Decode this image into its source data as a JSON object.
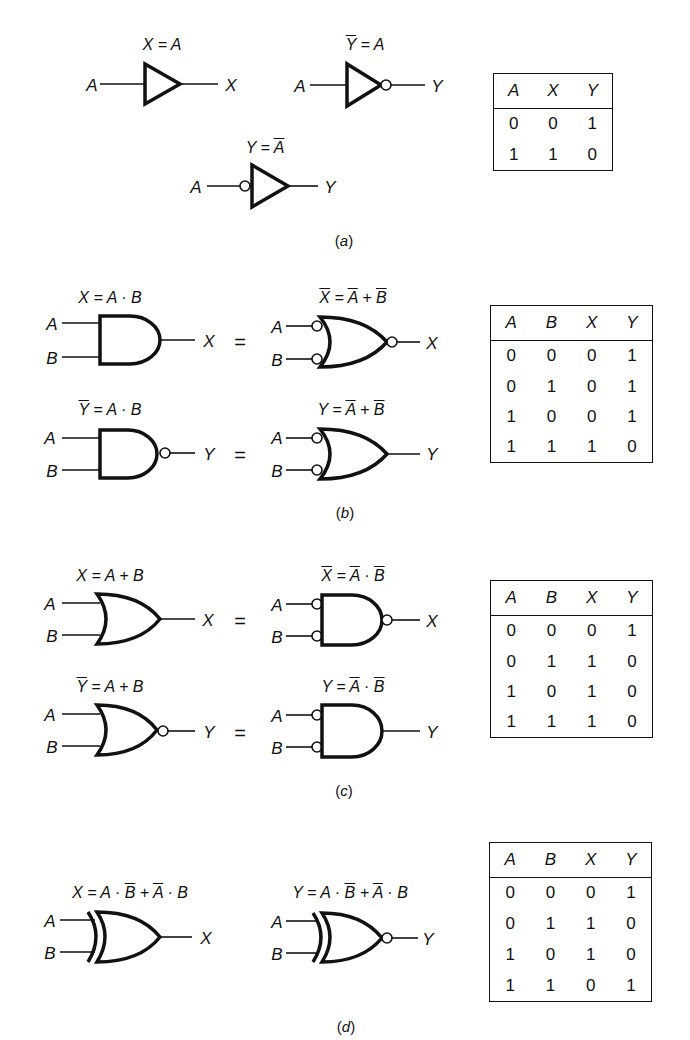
{
  "sections": [
    {
      "id": "a",
      "caption": "a",
      "equations": [
        "X = A",
        "Y = A",
        "Y = A"
      ],
      "gates": [
        {
          "type": "buffer",
          "input": "A",
          "output": "X",
          "equation": {
            "lhs": "X",
            "lhs_bar": false,
            "rhs": "A"
          }
        },
        {
          "type": "inverter",
          "input": "A",
          "output": "Y",
          "equation": {
            "lhs": "Y",
            "lhs_bar": true,
            "rhs": "A"
          }
        },
        {
          "type": "inverter-input-bubble",
          "input": "A",
          "output": "Y",
          "equation": {
            "lhs": "Y",
            "lhs_bar": false,
            "rhs": "A",
            "rhs_bar": true
          }
        }
      ],
      "truth_table": {
        "headers": [
          "A",
          "X",
          "Y"
        ],
        "rows": [
          [
            "0",
            "0",
            "1"
          ],
          [
            "1",
            "1",
            "0"
          ]
        ]
      }
    },
    {
      "id": "b",
      "caption": "b",
      "rows": [
        {
          "left": {
            "gate": "AND",
            "eq": "X = A · B"
          },
          "right": {
            "gate": "NOR-inverted-inputs",
            "eq": "X = A + B",
            "bars": [
              "X",
              "A",
              "B"
            ]
          },
          "output": "X"
        },
        {
          "left": {
            "gate": "NAND",
            "eq": "Y = A · B",
            "bars": [
              "Y"
            ]
          },
          "right": {
            "gate": "OR-inverted-inputs",
            "eq": "Y = A + B",
            "bars": [
              "A",
              "B"
            ]
          },
          "output": "Y"
        }
      ],
      "truth_table": {
        "headers": [
          "A",
          "B",
          "X",
          "Y"
        ],
        "rows": [
          [
            "0",
            "0",
            "0",
            "1"
          ],
          [
            "0",
            "1",
            "0",
            "1"
          ],
          [
            "1",
            "0",
            "0",
            "1"
          ],
          [
            "1",
            "1",
            "1",
            "0"
          ]
        ]
      }
    },
    {
      "id": "c",
      "caption": "c",
      "rows": [
        {
          "left": {
            "gate": "OR",
            "eq": "X = A + B"
          },
          "right": {
            "gate": "NAND-inverted-inputs",
            "eq": "X = A · B",
            "bars": [
              "X",
              "A",
              "B"
            ]
          },
          "output": "X"
        },
        {
          "left": {
            "gate": "NOR",
            "eq": "Y = A + B",
            "bars": [
              "Y"
            ]
          },
          "right": {
            "gate": "AND-inverted-inputs",
            "eq": "Y = A · B",
            "bars": [
              "A",
              "B"
            ]
          },
          "output": "Y"
        }
      ],
      "truth_table": {
        "headers": [
          "A",
          "B",
          "X",
          "Y"
        ],
        "rows": [
          [
            "0",
            "0",
            "0",
            "1"
          ],
          [
            "0",
            "1",
            "1",
            "0"
          ],
          [
            "1",
            "0",
            "1",
            "0"
          ],
          [
            "1",
            "1",
            "1",
            "0"
          ]
        ]
      }
    },
    {
      "id": "d",
      "caption": "d",
      "gates": [
        {
          "gate": "XOR",
          "eq": "X = A · B + A · B",
          "output": "X"
        },
        {
          "gate": "XNOR",
          "eq": "Y = A · B + A · B",
          "output": "Y"
        }
      ],
      "truth_table": {
        "headers": [
          "A",
          "B",
          "X",
          "Y"
        ],
        "rows": [
          [
            "0",
            "0",
            "0",
            "1"
          ],
          [
            "0",
            "1",
            "1",
            "0"
          ],
          [
            "1",
            "0",
            "1",
            "0"
          ],
          [
            "1",
            "1",
            "0",
            "1"
          ]
        ]
      }
    }
  ],
  "symbols": {
    "A": "A",
    "B": "B",
    "X": "X",
    "Y": "Y",
    "eq": "=",
    "and": "·",
    "or": "+"
  }
}
